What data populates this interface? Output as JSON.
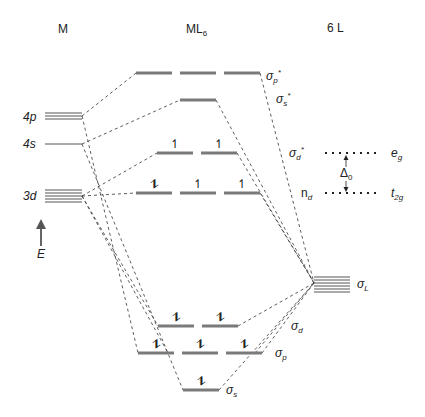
{
  "column_headers": {
    "metal": "M",
    "complex": "ML",
    "complex_sub": "6",
    "ligands": "6 L"
  },
  "metal_orbitals": [
    {
      "label": "4p",
      "degeneracy": 3
    },
    {
      "label": "4s",
      "degeneracy": 1
    },
    {
      "label": "3d",
      "degeneracy": 5
    }
  ],
  "energy_axis": {
    "label": "E",
    "icon": "arrow-up-icon"
  },
  "complex_orbitals": [
    {
      "label": "σ",
      "sub": "p",
      "sup": "*",
      "degeneracy": 3,
      "electrons": [
        "",
        "",
        ""
      ]
    },
    {
      "label": "σ",
      "sub": "s",
      "sup": "*",
      "degeneracy": 1,
      "electrons": [
        ""
      ]
    },
    {
      "label": "σ",
      "sub": "d",
      "sup": "*",
      "degeneracy": 2,
      "electrons": [
        "↿",
        "↿"
      ]
    },
    {
      "label": "n",
      "sub": "d",
      "sup": "",
      "degeneracy": 3,
      "electrons": [
        "⥮",
        "↿",
        "↿"
      ]
    },
    {
      "label": "σ",
      "sub": "d",
      "sup": "",
      "degeneracy": 2,
      "electrons": [
        "⥮",
        "⥮"
      ]
    },
    {
      "label": "σ",
      "sub": "p",
      "sup": "",
      "degeneracy": 3,
      "electrons": [
        "⥮",
        "⥮",
        "⥮"
      ]
    },
    {
      "label": "σ",
      "sub": "s",
      "sup": "",
      "degeneracy": 1,
      "electrons": [
        "⥮"
      ]
    }
  ],
  "ligand_orbitals": {
    "label": "σ",
    "sub": "L",
    "degeneracy": 6
  },
  "splitting": {
    "upper": {
      "label": "e",
      "sub": "g"
    },
    "lower": {
      "label": "t",
      "sub": "2g"
    },
    "gap": {
      "label": "Δ",
      "sub": "0"
    }
  },
  "colors": {
    "level": "#7a7a7a",
    "dash": "#333333",
    "text": "#222222"
  }
}
